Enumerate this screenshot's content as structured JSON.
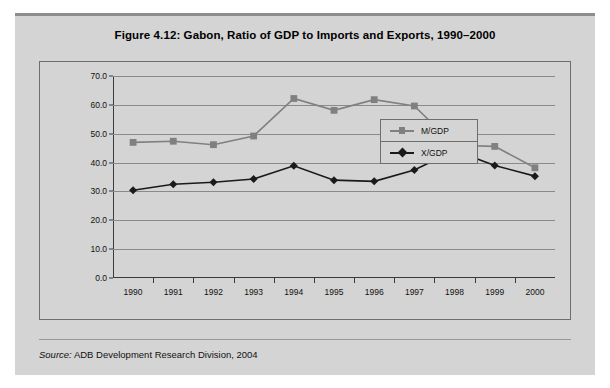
{
  "figure": {
    "title": "Figure 4.12:  Gabon, Ratio of GDP to Imports and Exports, 1990–2000",
    "source_word": "Source:",
    "source_text": "ADB Development Research Division, 2004"
  },
  "colors": {
    "panel_bg": "#d4d4d4",
    "frame_border": "#6e6e6e",
    "gridline": "#8a8a8a",
    "axis": "#3a3a3a",
    "series_mgdp": "#808080",
    "series_xgdp": "#1a1a1a",
    "page_bg": "#ffffff"
  },
  "chart_data": {
    "type": "line",
    "title": "Figure 4.12:  Gabon, Ratio of GDP to Imports and Exports, 1990–2000",
    "xlabel": "",
    "ylabel": "",
    "categories": [
      "1990",
      "1991",
      "1992",
      "1993",
      "1994",
      "1995",
      "1996",
      "1997",
      "1998",
      "1999",
      "2000"
    ],
    "ylim": [
      0.0,
      70.0
    ],
    "ytick_labels": [
      "70.0",
      "60.0",
      "50.0",
      "40.0",
      "30.0",
      "20.0",
      "10.0",
      "0.0"
    ],
    "ytick_values": [
      70.0,
      60.0,
      50.0,
      40.0,
      30.0,
      20.0,
      10.0,
      0.0
    ],
    "grid": true,
    "legend_position": "inside-right",
    "series": [
      {
        "name": "M/GDP",
        "marker": "square",
        "color": "#808080",
        "values": [
          47.0,
          47.4,
          46.2,
          49.2,
          62.2,
          58.1,
          61.8,
          59.6,
          46.0,
          45.6,
          38.2
        ]
      },
      {
        "name": "X/GDP",
        "marker": "diamond",
        "color": "#1a1a1a",
        "values": [
          30.4,
          32.5,
          33.2,
          34.3,
          38.9,
          33.9,
          33.5,
          37.4,
          44.2,
          39.0,
          35.3
        ]
      }
    ]
  }
}
